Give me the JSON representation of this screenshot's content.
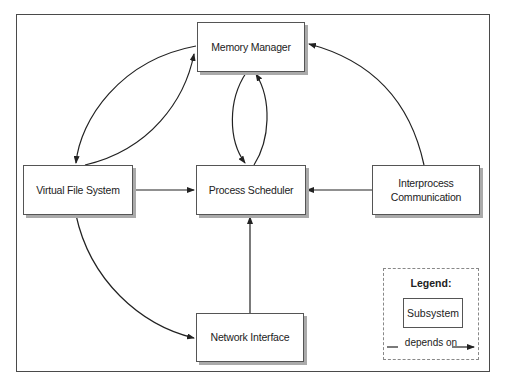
{
  "diagram": {
    "nodes": [
      {
        "id": "memory_manager",
        "label": "Memory Manager"
      },
      {
        "id": "virtual_file_system",
        "label": "Virtual File System"
      },
      {
        "id": "process_scheduler",
        "label": "Process Scheduler"
      },
      {
        "id": "interprocess_communication",
        "label": "Interprocess\nCommunication"
      },
      {
        "id": "network_interface",
        "label": "Network Interface"
      }
    ],
    "edges": [
      {
        "from": "virtual_file_system",
        "to": "memory_manager"
      },
      {
        "from": "memory_manager",
        "to": "virtual_file_system"
      },
      {
        "from": "memory_manager",
        "to": "process_scheduler"
      },
      {
        "from": "process_scheduler",
        "to": "memory_manager"
      },
      {
        "from": "virtual_file_system",
        "to": "process_scheduler"
      },
      {
        "from": "interprocess_communication",
        "to": "process_scheduler"
      },
      {
        "from": "interprocess_communication",
        "to": "memory_manager"
      },
      {
        "from": "network_interface",
        "to": "process_scheduler"
      },
      {
        "from": "virtual_file_system",
        "to": "network_interface"
      }
    ],
    "legend": {
      "title": "Legend:",
      "node_label": "Subsystem",
      "edge_label": "depends on"
    }
  },
  "colors": {
    "line": "#222222",
    "box_border": "#555555",
    "shadow": "#aaaaaa",
    "frame": "#4a4a4a"
  }
}
